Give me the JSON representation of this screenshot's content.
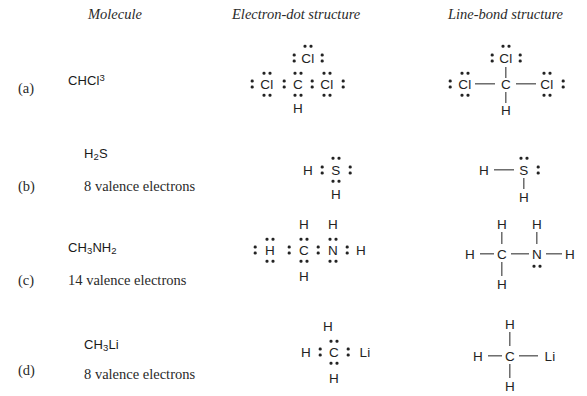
{
  "headers": {
    "molecule": "Molecule",
    "electron_dot": "Electron-dot structure",
    "line_bond": "Line-bond structure"
  },
  "rows": [
    {
      "label": "(a)",
      "formula_html": "CHCl<sup>3</sup>",
      "formula_text": "CHCl3",
      "caption": "",
      "electron_dot": {
        "atoms": [
          "Cl",
          "Cl",
          "C",
          "Cl",
          "H"
        ],
        "description": "Central C bonded by shared electron pairs to three Cl and one H; each Cl carries three lone pairs"
      },
      "line_bond": {
        "atoms": [
          "Cl",
          "Cl",
          "C",
          "Cl",
          "H"
        ],
        "description": "Central C with bond lines to three Cl and one H; each Cl shows three lone pairs"
      }
    },
    {
      "label": "(b)",
      "formula_html": "H<sub>2</sub>S",
      "formula_text": "H2S",
      "caption": "8 valence electrons",
      "electron_dot": {
        "atoms": [
          "H",
          "S",
          "H"
        ],
        "description": "S shares electron pairs with two H and carries two lone pairs"
      },
      "line_bond": {
        "atoms": [
          "H",
          "S",
          "H"
        ],
        "description": "H bonded to S by line, second H below S; S shows two lone pairs"
      }
    },
    {
      "label": "(c)",
      "formula_html": "CH<sub>3</sub>NH<sub>2</sub>",
      "formula_text": "CH3NH2",
      "caption": "14 valence electrons",
      "electron_dot": {
        "atoms": [
          "H",
          "H",
          "H",
          "C",
          "N",
          "H",
          "H"
        ],
        "description": "C bonded to three H and to N; N bonded to two H and carries one lone pair"
      },
      "line_bond": {
        "atoms": [
          "H",
          "H",
          "H",
          "C",
          "N",
          "H",
          "H"
        ],
        "description": "H-C-N-H skeleton with H above and below C, H above N, lone pair below N"
      }
    },
    {
      "label": "(d)",
      "formula_html": "CH<sub>3</sub>Li",
      "formula_text": "CH3Li",
      "caption": "8 valence electrons",
      "electron_dot": {
        "atoms": [
          "H",
          "H",
          "C",
          "Li",
          "H"
        ],
        "description": "C shares electron pairs with three H and with Li"
      },
      "line_bond": {
        "atoms": [
          "H",
          "H",
          "C",
          "Li",
          "H"
        ],
        "description": "H-C-Li with H above and below C"
      }
    }
  ],
  "colors": {
    "ink": "#232323",
    "text": "#2a2a2a",
    "background": "#ffffff"
  }
}
